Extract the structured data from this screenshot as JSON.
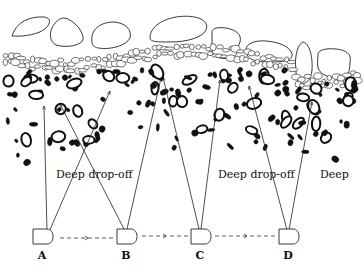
{
  "diagram": {
    "colors": {
      "ink": "#111111",
      "background": "#ffffff"
    },
    "region_labels": [
      {
        "id": "drop1",
        "text": "Deep drop-off",
        "x": 56,
        "y": 178
      },
      {
        "id": "drop2",
        "text": "Deep drop-off",
        "x": 218,
        "y": 178
      },
      {
        "id": "deep",
        "text": "Deep",
        "x": 320,
        "y": 178
      }
    ],
    "positions": [
      {
        "id": "A",
        "label": "A",
        "x": 42,
        "label_x": 42,
        "label_y": 259
      },
      {
        "id": "B",
        "label": "B",
        "x": 126,
        "label_x": 126,
        "label_y": 259
      },
      {
        "id": "C",
        "label": "C",
        "x": 200,
        "label_x": 200,
        "label_y": 259
      },
      {
        "id": "D",
        "label": "D",
        "x": 288,
        "label_x": 288,
        "label_y": 259
      }
    ],
    "beams": [
      {
        "from": "A",
        "x1": 47,
        "y1": 232,
        "x2": 44,
        "y2": 106
      },
      {
        "from": "A",
        "x1": 49,
        "y1": 232,
        "x2": 110,
        "y2": 91
      },
      {
        "from": "B",
        "x1": 124,
        "y1": 229,
        "x2": 60,
        "y2": 104
      },
      {
        "from": "B",
        "x1": 127,
        "y1": 229,
        "x2": 161,
        "y2": 78
      },
      {
        "from": "C",
        "x1": 199,
        "y1": 229,
        "x2": 163,
        "y2": 77
      },
      {
        "from": "C",
        "x1": 201,
        "y1": 229,
        "x2": 220,
        "y2": 80
      },
      {
        "from": "D",
        "x1": 287,
        "y1": 230,
        "x2": 249,
        "y2": 86
      },
      {
        "from": "D",
        "x1": 289,
        "y1": 230,
        "x2": 312,
        "y2": 102
      }
    ],
    "track_segments": [
      {
        "x1": 60,
        "x2": 114,
        "y": 238
      },
      {
        "x1": 142,
        "x2": 188,
        "y": 236
      },
      {
        "x1": 215,
        "x2": 277,
        "y": 236
      }
    ]
  }
}
